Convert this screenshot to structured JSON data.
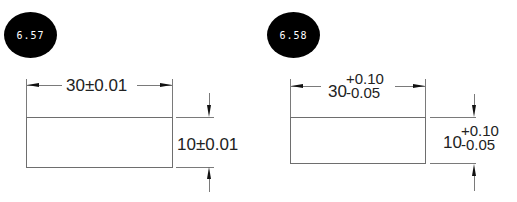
{
  "figures": [
    {
      "label": "6.57",
      "width_dim": {
        "nominal": "30",
        "tolerance": "±0.01",
        "text": "30±0.01"
      },
      "height_dim": {
        "nominal": "10",
        "tolerance": "±0.01",
        "text": "10±0.01"
      }
    },
    {
      "label": "6.58",
      "width_dim": {
        "nominal": "30",
        "upper": "+0.10",
        "lower": "-0.05"
      },
      "height_dim": {
        "nominal": "10",
        "upper": "+0.10",
        "lower": "-0.05"
      }
    }
  ],
  "colors": {
    "badge": "#000000",
    "badge_text": "#ffffff",
    "lines": "#7a7a7a",
    "arrows": "#111111",
    "text": "#222222"
  }
}
